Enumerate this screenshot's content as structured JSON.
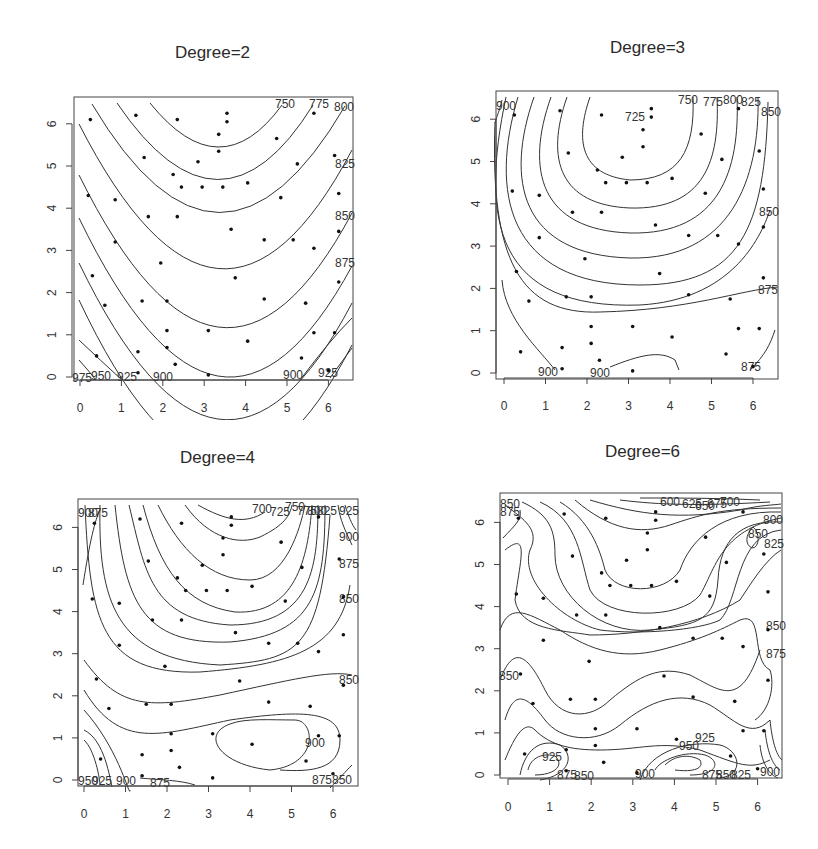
{
  "chart_data": [
    {
      "type": "contour",
      "title": "Degree=2",
      "xlabel": "",
      "ylabel": "",
      "xticks": [
        0,
        1,
        2,
        3,
        4,
        5,
        6
      ],
      "yticks": [
        0,
        1,
        2,
        3,
        4,
        5,
        6
      ],
      "xlim": [
        -0.1,
        6.5
      ],
      "ylim": [
        -0.1,
        6.6
      ],
      "grid": false,
      "contour_levels": [
        750,
        775,
        800,
        825,
        850,
        875,
        900,
        925,
        950,
        975
      ],
      "contour_labels": [
        "750",
        "775",
        "800",
        "825",
        "850",
        "875",
        "975",
        "950",
        "925",
        "900",
        "900",
        "925"
      ]
    },
    {
      "type": "contour",
      "title": "Degree=3",
      "xlabel": "",
      "ylabel": "",
      "xticks": [
        0,
        1,
        2,
        3,
        4,
        5,
        6
      ],
      "yticks": [
        0,
        1,
        2,
        3,
        4,
        5,
        6
      ],
      "xlim": [
        -0.1,
        6.5
      ],
      "ylim": [
        -0.1,
        6.6
      ],
      "grid": false,
      "contour_levels": [
        725,
        750,
        775,
        800,
        825,
        850,
        875,
        900
      ],
      "contour_labels": [
        "900",
        "725",
        "750",
        "775",
        "800",
        "825",
        "850",
        "850",
        "875",
        "900",
        "900",
        "875"
      ]
    },
    {
      "type": "contour",
      "title": "Degree=4",
      "xlabel": "",
      "ylabel": "",
      "xticks": [
        0,
        1,
        2,
        3,
        4,
        5,
        6
      ],
      "yticks": [
        0,
        1,
        2,
        3,
        4,
        5,
        6
      ],
      "xlim": [
        -0.1,
        6.5
      ],
      "ylim": [
        -0.1,
        6.6
      ],
      "grid": false,
      "contour_levels": [
        700,
        725,
        750,
        775,
        800,
        825,
        850,
        875,
        900,
        925,
        950
      ],
      "contour_labels": [
        "900",
        "875",
        "700",
        "725",
        "750",
        "775",
        "800",
        "825",
        "925",
        "900",
        "875",
        "850",
        "850",
        "950",
        "925",
        "900",
        "875",
        "900",
        "875",
        "850"
      ]
    },
    {
      "type": "contour",
      "title": "Degree=6",
      "xlabel": "",
      "ylabel": "",
      "xticks": [
        0,
        1,
        2,
        3,
        4,
        5,
        6
      ],
      "yticks": [
        0,
        1,
        2,
        3,
        4,
        5,
        6
      ],
      "xlim": [
        -0.1,
        6.5
      ],
      "ylim": [
        -0.1,
        6.6
      ],
      "grid": false,
      "contour_levels": [
        600,
        625,
        650,
        675,
        700,
        725,
        750,
        775,
        800,
        825,
        850,
        875,
        900,
        925,
        950
      ],
      "contour_labels": [
        "850",
        "875",
        "600",
        "625",
        "650",
        "675",
        "700",
        "800",
        "850",
        "825",
        "850",
        "875",
        "850",
        "925",
        "950",
        "925",
        "875",
        "850",
        "900",
        "875",
        "850",
        "825",
        "900"
      ]
    }
  ],
  "sample_points": [
    [
      0.25,
      6.1
    ],
    [
      1.35,
      6.2
    ],
    [
      2.35,
      6.1
    ],
    [
      3.55,
      6.25
    ],
    [
      3.55,
      6.05
    ],
    [
      3.35,
      5.75
    ],
    [
      4.75,
      5.65
    ],
    [
      5.65,
      6.25
    ],
    [
      1.55,
      5.2
    ],
    [
      3.35,
      5.35
    ],
    [
      2.85,
      5.1
    ],
    [
      5.25,
      5.05
    ],
    [
      6.15,
      5.25
    ],
    [
      2.25,
      4.8
    ],
    [
      2.45,
      4.5
    ],
    [
      2.95,
      4.5
    ],
    [
      3.45,
      4.5
    ],
    [
      4.05,
      4.6
    ],
    [
      0.2,
      4.3
    ],
    [
      0.85,
      4.2
    ],
    [
      4.85,
      4.25
    ],
    [
      6.25,
      4.35
    ],
    [
      1.65,
      3.8
    ],
    [
      2.35,
      3.8
    ],
    [
      3.65,
      3.5
    ],
    [
      6.25,
      3.45
    ],
    [
      0.85,
      3.2
    ],
    [
      4.45,
      3.25
    ],
    [
      5.15,
      3.25
    ],
    [
      5.65,
      3.05
    ],
    [
      1.95,
      2.7
    ],
    [
      3.75,
      2.35
    ],
    [
      0.3,
      2.4
    ],
    [
      6.25,
      2.25
    ],
    [
      0.6,
      1.7
    ],
    [
      1.5,
      1.8
    ],
    [
      2.1,
      1.8
    ],
    [
      4.45,
      1.85
    ],
    [
      5.45,
      1.75
    ],
    [
      2.1,
      1.1
    ],
    [
      3.1,
      1.1
    ],
    [
      5.65,
      1.05
    ],
    [
      6.15,
      1.05
    ],
    [
      4.05,
      0.85
    ],
    [
      2.1,
      0.7
    ],
    [
      1.4,
      0.6
    ],
    [
      0.4,
      0.5
    ],
    [
      5.35,
      0.45
    ],
    [
      2.3,
      0.3
    ],
    [
      1.4,
      0.1
    ],
    [
      3.1,
      0.05
    ],
    [
      6.0,
      0.15
    ]
  ],
  "panels": {
    "p1": {
      "title": "Degree=2"
    },
    "p2": {
      "title": "Degree=3"
    },
    "p3": {
      "title": "Degree=4"
    },
    "p4": {
      "title": "Degree=6"
    }
  },
  "axis_ticks": [
    "0",
    "1",
    "2",
    "3",
    "4",
    "5",
    "6"
  ],
  "colors": {
    "line": "#333333",
    "point": "#111111",
    "frame": "#444444",
    "background": "#ffffff"
  }
}
